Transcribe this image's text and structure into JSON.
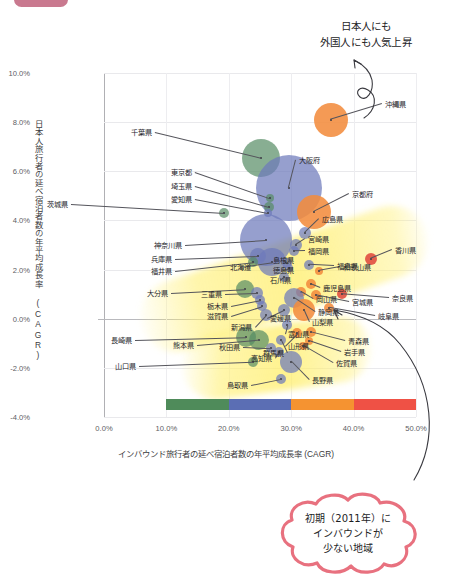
{
  "chart_data": {
    "type": "scatter",
    "title": "",
    "xlabel": "インバウンド旅行者の延べ宿泊者数の年平均成長率 (CAGR)",
    "ylabel": "日本人旅行者の延べ宿泊者数の年平均成長率 (CAGR)",
    "xlim": [
      0.0,
      50.0
    ],
    "ylim": [
      -4.0,
      10.0
    ],
    "x_ticks": [
      "0.0%",
      "10.0%",
      "20.0%",
      "30.0%",
      "40.0%",
      "50.0%"
    ],
    "y_ticks": [
      "10.0%",
      "8.0%",
      "6.0%",
      "4.0%",
      "2.0%",
      "0.0%",
      "-2.0%",
      "-4.0%"
    ],
    "grid": true,
    "legend": "none",
    "bubble_size_meaning": "延べ宿泊者数規模",
    "color_scale": {
      "label": "インバウンド年平均成長率帯",
      "stops": [
        {
          "range": "10.0%-20.0%",
          "color": "#4f8b5a"
        },
        {
          "range": "20.0%-30.0%",
          "color": "#5b6eb4"
        },
        {
          "range": "30.0%-40.0%",
          "color": "#f59331"
        },
        {
          "range": "40.0%-50.0%",
          "color": "#ef5145"
        }
      ]
    },
    "points": [
      {
        "label": "沖縄県",
        "x": 36.3,
        "y": 8.1,
        "r": 17,
        "color": "orange",
        "lx": 385,
        "ly": 104,
        "anchor": "l"
      },
      {
        "label": "千葉県",
        "x": 25.2,
        "y": 6.55,
        "r": 19,
        "color": "green",
        "lx": 152,
        "ly": 132,
        "anchor": "r"
      },
      {
        "label": "大阪府",
        "x": 29.6,
        "y": 5.3,
        "r": 33,
        "color": "blue",
        "lx": 299,
        "ly": 160,
        "anchor": "l"
      },
      {
        "label": "東京都",
        "x": 26.6,
        "y": 4.9,
        "r": 4,
        "color": "green",
        "lx": 192,
        "ly": 172,
        "anchor": "r"
      },
      {
        "label": "埼玉県",
        "x": 26.4,
        "y": 4.55,
        "r": 5,
        "color": "green",
        "lx": 192,
        "ly": 186,
        "anchor": "r"
      },
      {
        "label": "愛知県",
        "x": 26.3,
        "y": 4.3,
        "r": 4,
        "color": "blue",
        "lx": 192,
        "ly": 199,
        "anchor": "r"
      },
      {
        "label": "京都府",
        "x": 33.6,
        "y": 4.35,
        "r": 17,
        "color": "orange",
        "lx": 352,
        "ly": 194,
        "anchor": "l"
      },
      {
        "label": "茨城県",
        "x": 19.3,
        "y": 4.3,
        "r": 5,
        "color": "green",
        "lx": 68,
        "ly": 204,
        "anchor": "r"
      },
      {
        "label": "広島県",
        "x": 32.2,
        "y": 3.5,
        "r": 6,
        "color": "blue",
        "lx": 322,
        "ly": 219,
        "anchor": "l"
      },
      {
        "label": "宮崎県",
        "x": 30.7,
        "y": 3.0,
        "r": 6,
        "color": "blue",
        "lx": 308,
        "ly": 239,
        "anchor": "l"
      },
      {
        "label": "福岡県",
        "x": 30.4,
        "y": 2.75,
        "r": 5,
        "color": "blue",
        "lx": 308,
        "ly": 251,
        "anchor": "l"
      },
      {
        "label": "神奈川県",
        "x": 26.0,
        "y": 3.2,
        "r": 26,
        "color": "blue",
        "lx": 182,
        "ly": 245,
        "anchor": "r"
      },
      {
        "label": "兵庫県",
        "x": 24.6,
        "y": 2.55,
        "r": 8,
        "color": "blue",
        "lx": 172,
        "ly": 259,
        "anchor": "r"
      },
      {
        "label": "福井県",
        "x": 23.9,
        "y": 2.3,
        "r": 5,
        "color": "green",
        "lx": 172,
        "ly": 271,
        "anchor": "r"
      },
      {
        "label": "北海道",
        "x": 27.0,
        "y": 2.3,
        "r": 14,
        "color": "blue",
        "lx": 240,
        "ly": 267,
        "anchor": "c"
      },
      {
        "label": "島根県",
        "x": 29.4,
        "y": 2.25,
        "r": 5,
        "color": "blue",
        "lx": 283,
        "ly": 260,
        "anchor": "c"
      },
      {
        "label": "徳島県",
        "x": 29.7,
        "y": 2.05,
        "r": 4,
        "color": "blue",
        "lx": 283,
        "ly": 270,
        "anchor": "c"
      },
      {
        "label": "石川県",
        "x": 28.8,
        "y": 1.7,
        "r": 5,
        "color": "blue",
        "lx": 280,
        "ly": 280,
        "anchor": "c"
      },
      {
        "label": "福島県",
        "x": 32.9,
        "y": 2.2,
        "r": 5,
        "color": "blue",
        "lx": 337,
        "ly": 266,
        "anchor": "l"
      },
      {
        "label": "和歌山県",
        "x": 34.5,
        "y": 1.95,
        "r": 4,
        "color": "orange",
        "lx": 343,
        "ly": 267,
        "anchor": "l"
      },
      {
        "label": "鹿児島県",
        "x": 33.2,
        "y": 1.4,
        "r": 5,
        "color": "orange",
        "lx": 323,
        "ly": 288,
        "anchor": "l"
      },
      {
        "label": "香川県",
        "x": 42.8,
        "y": 2.45,
        "r": 6,
        "color": "red",
        "lx": 395,
        "ly": 250,
        "anchor": "l"
      },
      {
        "label": "岡山県",
        "x": 31.5,
        "y": 1.1,
        "r": 5,
        "color": "orange",
        "lx": 316,
        "ly": 299,
        "anchor": "l"
      },
      {
        "label": "大分県",
        "x": 22.6,
        "y": 1.2,
        "r": 9,
        "color": "green",
        "lx": 168,
        "ly": 293,
        "anchor": "r"
      },
      {
        "label": "三重県",
        "x": 24.5,
        "y": 1.05,
        "r": 6,
        "color": "blue",
        "lx": 222,
        "ly": 294,
        "anchor": "r"
      },
      {
        "label": "静岡県",
        "x": 30.4,
        "y": 0.85,
        "r": 10,
        "color": "blue",
        "lx": 318,
        "ly": 312,
        "anchor": "l"
      },
      {
        "label": "宮城県",
        "x": 34.0,
        "y": 0.95,
        "r": 5,
        "color": "orange",
        "lx": 352,
        "ly": 302,
        "anchor": "l"
      },
      {
        "label": "奈良県",
        "x": 38.1,
        "y": 1.0,
        "r": 5,
        "color": "red",
        "lx": 392,
        "ly": 298,
        "anchor": "l"
      },
      {
        "label": "栃木県",
        "x": 25.0,
        "y": 0.75,
        "r": 5,
        "color": "blue",
        "lx": 228,
        "ly": 306,
        "anchor": "r"
      },
      {
        "label": "滋賀県",
        "x": 25.3,
        "y": 0.5,
        "r": 5,
        "color": "blue",
        "lx": 228,
        "ly": 316,
        "anchor": "r"
      },
      {
        "label": "愛媛県",
        "x": 28.8,
        "y": 0.35,
        "r": 6,
        "color": "blue",
        "lx": 270,
        "ly": 318,
        "anchor": "l"
      },
      {
        "label": "山梨県",
        "x": 32.0,
        "y": 0.35,
        "r": 11,
        "color": "orange",
        "lx": 312,
        "ly": 322,
        "anchor": "l"
      },
      {
        "label": "岐阜県",
        "x": 36.0,
        "y": 0.45,
        "r": 5,
        "color": "orange",
        "lx": 378,
        "ly": 316,
        "anchor": "l"
      },
      {
        "label": "新潟県",
        "x": 26.0,
        "y": 0.15,
        "r": 6,
        "color": "blue",
        "lx": 252,
        "ly": 327,
        "anchor": "r"
      },
      {
        "label": "富山県",
        "x": 29.4,
        "y": -0.25,
        "r": 5,
        "color": "blue",
        "lx": 288,
        "ly": 334,
        "anchor": "l"
      },
      {
        "label": "山形県",
        "x": 31.0,
        "y": -0.6,
        "r": 5,
        "color": "orange",
        "lx": 288,
        "ly": 346,
        "anchor": "l"
      },
      {
        "label": "群馬県",
        "x": 28.3,
        "y": -0.85,
        "r": 5,
        "color": "blue",
        "lx": 284,
        "ly": 353,
        "anchor": "r"
      },
      {
        "label": "青森県",
        "x": 33.1,
        "y": -0.55,
        "r": 5,
        "color": "orange",
        "lx": 348,
        "ly": 341,
        "anchor": "l"
      },
      {
        "label": "岩手県",
        "x": 32.8,
        "y": -0.9,
        "r": 4,
        "color": "orange",
        "lx": 344,
        "ly": 352,
        "anchor": "l"
      },
      {
        "label": "佐賀県",
        "x": 31.9,
        "y": -1.1,
        "r": 4,
        "color": "orange",
        "lx": 336,
        "ly": 363,
        "anchor": "l"
      },
      {
        "label": "長崎県",
        "x": 22.7,
        "y": -0.75,
        "r": 10,
        "color": "green",
        "lx": 132,
        "ly": 340,
        "anchor": "r"
      },
      {
        "label": "熊本県",
        "x": 24.9,
        "y": -0.85,
        "r": 10,
        "color": "green",
        "lx": 194,
        "ly": 345,
        "anchor": "r"
      },
      {
        "label": "秋田県",
        "x": 26.8,
        "y": -1.2,
        "r": 5,
        "color": "blue",
        "lx": 240,
        "ly": 347,
        "anchor": "r"
      },
      {
        "label": "高知県",
        "x": 28.0,
        "y": -1.35,
        "r": 5,
        "color": "blue",
        "lx": 272,
        "ly": 358,
        "anchor": "r"
      },
      {
        "label": "山口県",
        "x": 23.9,
        "y": -1.75,
        "r": 5,
        "color": "green",
        "lx": 136,
        "ly": 366,
        "anchor": "r"
      },
      {
        "label": "長野県",
        "x": 30.0,
        "y": -1.75,
        "r": 11,
        "color": "blue",
        "lx": 312,
        "ly": 380,
        "anchor": "l"
      },
      {
        "label": "鳥取県",
        "x": 28.4,
        "y": -2.45,
        "r": 5,
        "color": "blue",
        "lx": 248,
        "ly": 385,
        "anchor": "r"
      }
    ]
  },
  "annotations": {
    "top_note_line1": "日本人にも",
    "top_note_line2": "外国人にも人気上昇",
    "cloud_line1": "初期（2011年）に",
    "cloud_line2": "インバウンドが",
    "cloud_line3": "少ない地域"
  },
  "colors": {
    "blue": "#6e7abb",
    "green": "#568c64",
    "orange": "#f28c3e",
    "red": "#e04a3e",
    "highlight": "#fff08c",
    "handwriting_pink": "#e8717f",
    "badge": "#c9798f"
  }
}
